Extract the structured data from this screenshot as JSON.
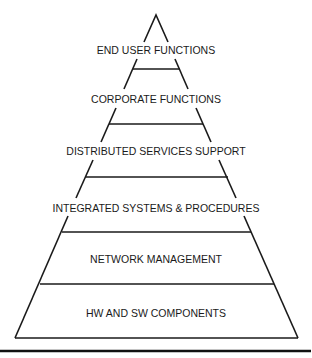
{
  "diagram": {
    "type": "pyramid",
    "title": "",
    "layers_top_to_bottom": [
      {
        "label": "END USER FUNCTIONS"
      },
      {
        "label": "CORPORATE FUNCTIONS"
      },
      {
        "label": "DISTRIBUTED SERVICES SUPPORT"
      },
      {
        "label": "INTEGRATED SYSTEMS & PROCEDURES"
      },
      {
        "label": "NETWORK MANAGEMENT"
      },
      {
        "label": "HW AND SW COMPONENTS"
      }
    ],
    "colors": {
      "line": "#1a1a1a",
      "text": "#1a1a1a",
      "background": "#ffffff"
    }
  }
}
